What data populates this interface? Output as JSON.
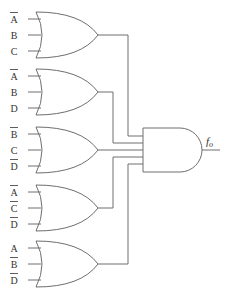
{
  "diagram": {
    "title": "",
    "type": "logic-circuit",
    "or_gates": [
      {
        "id": "or1",
        "inputs": [
          {
            "var": "A",
            "negated": true
          },
          {
            "var": "B",
            "negated": false
          },
          {
            "var": "C",
            "negated": false
          }
        ]
      },
      {
        "id": "or2",
        "inputs": [
          {
            "var": "A",
            "negated": true
          },
          {
            "var": "B",
            "negated": false
          },
          {
            "var": "D",
            "negated": false
          }
        ]
      },
      {
        "id": "or3",
        "inputs": [
          {
            "var": "B",
            "negated": true
          },
          {
            "var": "C",
            "negated": false
          },
          {
            "var": "D",
            "negated": true
          }
        ]
      },
      {
        "id": "or4",
        "inputs": [
          {
            "var": "A",
            "negated": true
          },
          {
            "var": "C",
            "negated": true
          },
          {
            "var": "D",
            "negated": true
          }
        ]
      },
      {
        "id": "or5",
        "inputs": [
          {
            "var": "A",
            "negated": false
          },
          {
            "var": "B",
            "negated": true
          },
          {
            "var": "D",
            "negated": true
          }
        ]
      }
    ],
    "and_gate": {
      "id": "and1",
      "inputs": [
        "or1",
        "or2",
        "or3",
        "or4",
        "or5"
      ]
    },
    "output": {
      "label": "f",
      "subscript": "o"
    },
    "colors": {
      "line": "#6e6e6e",
      "text": "#333333",
      "background": "#ffffff"
    }
  }
}
